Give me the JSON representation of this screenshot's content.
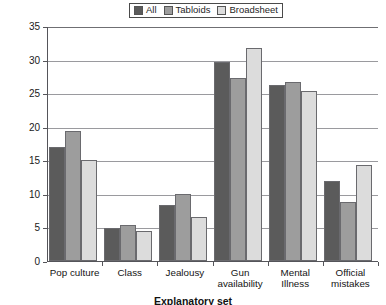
{
  "chart_data": {
    "type": "bar",
    "title": "",
    "xlabel": "Explanatory set",
    "ylabel": "Paragraphs (%)",
    "ylim": [
      0,
      35
    ],
    "ytick_step": 5,
    "yticks": [
      0,
      5,
      10,
      15,
      20,
      25,
      30,
      35
    ],
    "grid": true,
    "legend_position": "top-center",
    "categories": [
      "Pop culture",
      "Class",
      "Jealousy",
      "Gun availability",
      "Mental Illness",
      "Official mistakes"
    ],
    "category_lines": [
      [
        "Pop culture"
      ],
      [
        "Class"
      ],
      [
        "Jealousy"
      ],
      [
        "Gun",
        "availability"
      ],
      [
        "Mental",
        "Illness"
      ],
      [
        "Official",
        "mistakes"
      ]
    ],
    "series": [
      {
        "name": "All",
        "color": "#5b5b5b",
        "values": [
          17.0,
          4.9,
          8.3,
          29.7,
          26.2,
          11.9
        ]
      },
      {
        "name": "Tabloids",
        "color": "#9d9d9d",
        "values": [
          19.3,
          5.4,
          10.0,
          27.3,
          26.7,
          8.8
        ]
      },
      {
        "name": "Broadsheet",
        "color": "#dcdcdc",
        "values": [
          15.0,
          4.4,
          6.6,
          31.8,
          25.3,
          14.3
        ]
      }
    ]
  }
}
